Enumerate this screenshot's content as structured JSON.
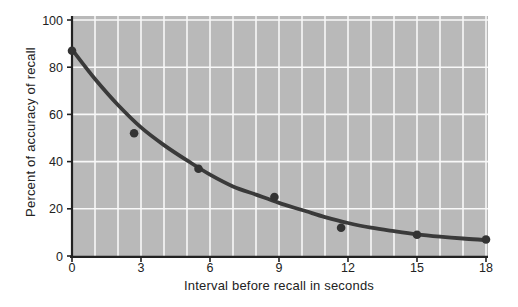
{
  "chart_data": {
    "type": "scatter",
    "title": "",
    "xlabel": "Interval before recall in seconds",
    "ylabel": "Percent of accuracy of recall",
    "xlim": [
      0,
      18
    ],
    "ylim": [
      0,
      100
    ],
    "xticks": [
      0,
      3,
      6,
      9,
      12,
      15,
      18
    ],
    "yticks": [
      0,
      20,
      40,
      60,
      80,
      100
    ],
    "grid": true,
    "x_grid_step": 1,
    "y_grid_step": 20,
    "legend": "none",
    "points": [
      {
        "x": 0,
        "y": 87
      },
      {
        "x": 2.7,
        "y": 52
      },
      {
        "x": 5.5,
        "y": 37
      },
      {
        "x": 8.8,
        "y": 25
      },
      {
        "x": 11.7,
        "y": 12
      },
      {
        "x": 15,
        "y": 9
      },
      {
        "x": 18,
        "y": 7
      }
    ],
    "curve": [
      [
        0,
        87.5
      ],
      [
        1,
        75
      ],
      [
        2,
        64
      ],
      [
        3,
        54.5
      ],
      [
        4,
        47
      ],
      [
        5,
        40.5
      ],
      [
        6,
        34.5
      ],
      [
        7,
        29.5
      ],
      [
        8,
        26
      ],
      [
        9,
        22.5
      ],
      [
        10,
        19.5
      ],
      [
        11,
        16.5
      ],
      [
        12,
        14
      ],
      [
        13,
        12
      ],
      [
        14,
        10.5
      ],
      [
        15,
        9.2
      ],
      [
        16,
        8.2
      ],
      [
        17,
        7.4
      ],
      [
        18,
        6.8
      ]
    ],
    "colors": {
      "page_bg": "#ffffff",
      "plot_bg": "#b9b9b9",
      "gridline": "#f8f8f8",
      "curve": "#3a3a3a",
      "point": "#333333",
      "axis": "#222222",
      "text": "#222222"
    }
  }
}
